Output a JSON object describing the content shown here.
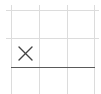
{
  "board": {
    "rows": 3,
    "cols": 3,
    "cells": [
      [
        "",
        "",
        ""
      ],
      [
        "X",
        "",
        ""
      ],
      [
        "",
        "",
        ""
      ]
    ],
    "marks": [
      {
        "row": 1,
        "col": 0,
        "symbol": "X",
        "icon": "x-mark-icon"
      }
    ]
  },
  "colors": {
    "grid_line": "#dcdcdc",
    "divider_line": "#5a5a5a",
    "mark": "#444444",
    "background": "#ffffff"
  }
}
